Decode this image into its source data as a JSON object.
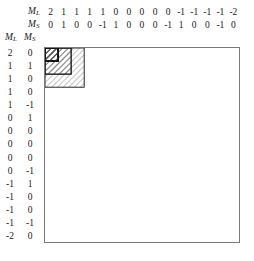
{
  "diagram": {
    "type": "block-diagonal-matrix",
    "title": "",
    "axis_labels": {
      "column_ml": "M",
      "column_ml_sub": "L",
      "column_ms": "M",
      "column_ms_sub": "S",
      "row_ml": "M",
      "row_ml_sub": "L",
      "row_ms": "M",
      "row_ms_sub": "S"
    },
    "columns": {
      "ML": [
        "2",
        "1",
        "1",
        "1",
        "1",
        "0",
        "0",
        "0",
        "0",
        "0",
        "-1",
        "-1",
        "-1",
        "-1",
        "-2"
      ],
      "MS": [
        "0",
        "1",
        "0",
        "0",
        "-1",
        "1",
        "0",
        "0",
        "0",
        "-1",
        "1",
        "0",
        "0",
        "-1",
        "0"
      ]
    },
    "rows": {
      "ML": [
        "2",
        "1",
        "1",
        "1",
        "1",
        "0",
        "0",
        "0",
        "0",
        "0",
        "-1",
        "-1",
        "-1",
        "-1",
        "-2"
      ],
      "MS": [
        "0",
        "1",
        "0",
        "0",
        "-1",
        "1",
        "0",
        "0",
        "0",
        "-1",
        "1",
        "0",
        "0",
        "-1",
        "0"
      ]
    },
    "matrix": {
      "size": 15,
      "block_sizes": [
        1,
        1,
        2,
        1,
        1,
        3,
        1,
        1,
        2,
        1,
        1
      ],
      "block_fill": "hatched",
      "hatch_angle_deg": 45,
      "border_color": "#7a7a7a",
      "block_border_color": "#111111",
      "hatch_color": "#555555",
      "background": "#ffffff"
    }
  }
}
